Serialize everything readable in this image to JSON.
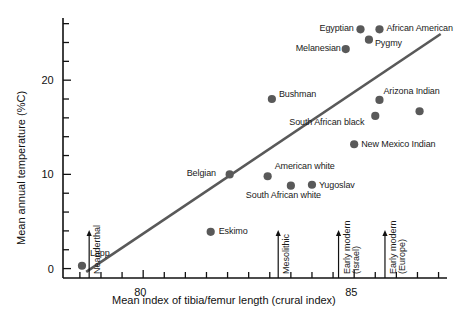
{
  "chart_data": {
    "type": "scatter",
    "title": "",
    "xlabel": "Mean index of tibia/femur length (crural index)",
    "ylabel": "Mean annual temperature (%C)",
    "xlim": [
      78.1,
      87.2
    ],
    "ylim": [
      -1.0,
      26.6
    ],
    "xticks_major": [
      80,
      85
    ],
    "xtick_labels": [
      "80",
      "85"
    ],
    "xticks_minor_step": 0.5,
    "yticks_major": [
      0,
      10,
      20
    ],
    "ytick_labels": [
      "0",
      "10",
      "20"
    ],
    "yticks_minor_step": 2,
    "grid": false,
    "legend": "none",
    "point_color": "#595959",
    "line_color": "#595959",
    "axis_color": "#111111",
    "points": [
      {
        "name": "Lapp",
        "x": 78.55,
        "y": 0.3,
        "label_dx": 8,
        "label_dy": -17
      },
      {
        "name": "Eskimo",
        "x": 81.6,
        "y": 3.9,
        "label_dx": 8,
        "label_dy": -5
      },
      {
        "name": "Belgian",
        "x": 82.05,
        "y": 10.0,
        "label_dx": -43,
        "label_dy": -5
      },
      {
        "name": "American white",
        "x": 82.95,
        "y": 9.8,
        "label_dx": 7,
        "label_dy": -14
      },
      {
        "name": "South African white",
        "x": 83.5,
        "y": 8.8,
        "label_dx": -45,
        "label_dy": 5
      },
      {
        "name": "Yugoslav",
        "x": 84.0,
        "y": 8.9,
        "label_dx": 7,
        "label_dy": -4
      },
      {
        "name": "Bushman",
        "x": 83.05,
        "y": 18.0,
        "label_dx": 7,
        "label_dy": -9
      },
      {
        "name": "New Mexico Indian",
        "x": 85.0,
        "y": 13.2,
        "label_dx": 7,
        "label_dy": -4
      },
      {
        "name": "South African black",
        "x": 85.5,
        "y": 16.2,
        "label_dx": -86,
        "label_dy": 2
      },
      {
        "name": "Arizona Indian",
        "x": 85.6,
        "y": 17.9,
        "label_dx": 4,
        "label_dy": -13
      },
      {
        "name": "Melanesian",
        "x": 84.8,
        "y": 23.3,
        "label_dx": -50,
        "label_dy": -5
      },
      {
        "name": "Egyptian",
        "x": 85.15,
        "y": 25.4,
        "label_dx": -41,
        "label_dy": -5
      },
      {
        "name": "African American",
        "x": 85.6,
        "y": 25.4,
        "label_dx": 7,
        "label_dy": -5
      },
      {
        "name": "Pygmy",
        "x": 85.35,
        "y": 24.3,
        "label_dx": 6,
        "label_dy": -1
      },
      {
        "name": "unlabeled-right",
        "x": 86.55,
        "y": 16.7,
        "label_dx": 0,
        "label_dy": 0
      }
    ],
    "trend_line": {
      "x1": 78.65,
      "y1": -0.35,
      "x2": 87.05,
      "y2": 24.9
    },
    "reference_arrows": [
      {
        "label_line1": "Neanderthal",
        "label_line2": "",
        "x": 78.72,
        "y_top": 4.0
      },
      {
        "label_line1": "Mesolithic",
        "label_line2": "",
        "x": 83.2,
        "y_top": 4.0
      },
      {
        "label_line1": "Early modern",
        "label_line2": "(Israel)",
        "x": 84.63,
        "y_top": 4.0
      },
      {
        "label_line1": "Early modern",
        "label_line2": "(Europe)",
        "x": 85.73,
        "y_top": 4.0
      }
    ]
  }
}
